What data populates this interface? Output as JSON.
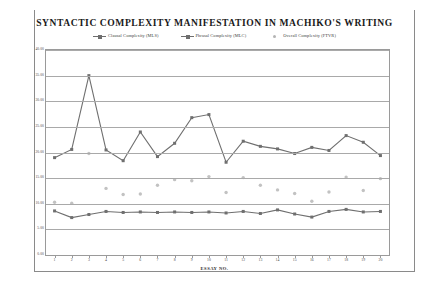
{
  "document": {
    "title_text": "SYNTACTIC COMPLEXITY MANIFESTATION IN MACHIKO'S WRITING"
  },
  "legend": {
    "items": [
      {
        "label": "Clausal Complexity (MLS)",
        "marker": "square-line-marker",
        "color": "#6f6f6f"
      },
      {
        "label": "Phrasal Complexity (MLC)",
        "marker": "square-line-marker",
        "color": "#6f6f6f"
      },
      {
        "label": "Overall Complexity (FTVR)",
        "marker": "scatter-dot-marker",
        "color": "#c2c2c2"
      }
    ]
  },
  "axes": {
    "y_ticks": [
      "0.00",
      "5.00",
      "10.00",
      "15.00",
      "20.00",
      "25.00",
      "30.00",
      "35.00",
      "40.00"
    ],
    "x_title": "ESSAY NO.",
    "x_ticks": [
      "1",
      "2",
      "3",
      "4",
      "5",
      "6",
      "7",
      "8",
      "9",
      "10",
      "11",
      "12",
      "13",
      "14",
      "15",
      "16",
      "17",
      "18",
      "19",
      "20"
    ]
  },
  "chart_data": {
    "type": "line",
    "title": "SYNTACTIC COMPLEXITY MANIFESTATION IN MACHIKO'S WRITING",
    "xlabel": "ESSAY NO.",
    "ylabel": "",
    "xlim": [
      1,
      20
    ],
    "ylim": [
      0,
      40
    ],
    "ytick_step": 5,
    "grid": true,
    "legend_position": "top-center",
    "categories": [
      1,
      2,
      3,
      4,
      5,
      6,
      7,
      8,
      9,
      10,
      11,
      12,
      13,
      14,
      15,
      16,
      17,
      18,
      19,
      20
    ],
    "series": [
      {
        "name": "Clausal Complexity (MLS)",
        "type": "line",
        "marker": "square",
        "color": "#6f6f6f",
        "values": [
          19.0,
          20.6,
          35.0,
          20.5,
          18.4,
          24.0,
          19.2,
          21.8,
          26.8,
          27.4,
          18.1,
          22.2,
          21.2,
          20.7,
          19.8,
          21.0,
          20.4,
          23.3,
          22.0,
          19.4
        ]
      },
      {
        "name": "Phrasal Complexity (MLC)",
        "type": "line",
        "marker": "square",
        "color": "#6f6f6f",
        "values": [
          8.6,
          7.3,
          7.9,
          8.5,
          8.3,
          8.4,
          8.3,
          8.4,
          8.3,
          8.4,
          8.2,
          8.5,
          8.1,
          8.8,
          8.0,
          7.4,
          8.5,
          8.9,
          8.4,
          8.5
        ]
      },
      {
        "name": "Overall Complexity (FTVR)",
        "type": "scatter",
        "marker": "dot",
        "color": "#c2c2c2",
        "values": [
          10.3,
          10.1,
          19.8,
          13.0,
          11.8,
          11.9,
          13.6,
          14.7,
          14.5,
          15.3,
          12.2,
          15.1,
          13.6,
          12.7,
          12.0,
          10.5,
          12.3,
          15.2,
          12.6,
          14.9
        ]
      }
    ]
  }
}
